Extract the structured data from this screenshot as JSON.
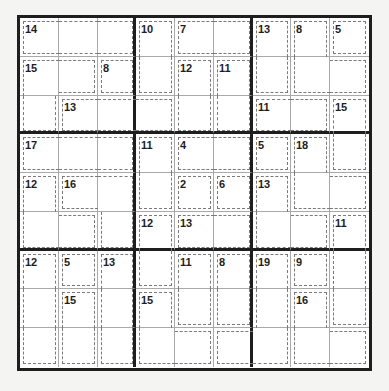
{
  "puzzle": {
    "type": "Killer Sudoku",
    "size": 9,
    "colors": {
      "background": "#ffffff",
      "thick_line": "#1e1e1e",
      "thin_line": "#a9a9a9",
      "cage_line": "#7a7a7a",
      "text": "#1e1e1e"
    },
    "cages": [
      {
        "sum": "14",
        "cells": [
          [
            0,
            0
          ],
          [
            0,
            1
          ],
          [
            0,
            2
          ]
        ]
      },
      {
        "sum": "10",
        "cells": [
          [
            0,
            3
          ],
          [
            1,
            3
          ]
        ]
      },
      {
        "sum": "7",
        "cells": [
          [
            0,
            4
          ],
          [
            0,
            5
          ]
        ]
      },
      {
        "sum": "13",
        "cells": [
          [
            0,
            6
          ],
          [
            1,
            6
          ]
        ]
      },
      {
        "sum": "8",
        "cells": [
          [
            0,
            7
          ],
          [
            1,
            7
          ],
          [
            1,
            8
          ]
        ]
      },
      {
        "sum": "5",
        "cells": [
          [
            0,
            8
          ]
        ]
      },
      {
        "sum": "15",
        "cells": [
          [
            1,
            0
          ],
          [
            1,
            1
          ],
          [
            2,
            0
          ]
        ]
      },
      {
        "sum": "8",
        "cells": [
          [
            1,
            2
          ]
        ]
      },
      {
        "sum": "12",
        "cells": [
          [
            1,
            4
          ],
          [
            2,
            4
          ]
        ]
      },
      {
        "sum": "11",
        "cells": [
          [
            1,
            5
          ],
          [
            2,
            5
          ]
        ]
      },
      {
        "sum": "13",
        "cells": [
          [
            2,
            1
          ],
          [
            2,
            2
          ],
          [
            2,
            3
          ]
        ]
      },
      {
        "sum": "11",
        "cells": [
          [
            2,
            6
          ],
          [
            2,
            7
          ]
        ]
      },
      {
        "sum": "15",
        "cells": [
          [
            2,
            8
          ],
          [
            3,
            8
          ]
        ]
      },
      {
        "sum": "17",
        "cells": [
          [
            3,
            0
          ],
          [
            3,
            1
          ],
          [
            3,
            2
          ]
        ]
      },
      {
        "sum": "11",
        "cells": [
          [
            3,
            3
          ],
          [
            4,
            3
          ]
        ]
      },
      {
        "sum": "4",
        "cells": [
          [
            3,
            4
          ],
          [
            3,
            5
          ]
        ]
      },
      {
        "sum": "5",
        "cells": [
          [
            3,
            6
          ]
        ]
      },
      {
        "sum": "18",
        "cells": [
          [
            3,
            7
          ],
          [
            4,
            7
          ],
          [
            4,
            8
          ]
        ]
      },
      {
        "sum": "12",
        "cells": [
          [
            4,
            0
          ],
          [
            5,
            0
          ],
          [
            5,
            1
          ]
        ]
      },
      {
        "sum": "16",
        "cells": [
          [
            4,
            1
          ],
          [
            4,
            2
          ],
          [
            5,
            2
          ]
        ]
      },
      {
        "sum": "2",
        "cells": [
          [
            4,
            4
          ]
        ]
      },
      {
        "sum": "6",
        "cells": [
          [
            4,
            5
          ]
        ]
      },
      {
        "sum": "13",
        "cells": [
          [
            4,
            6
          ],
          [
            5,
            6
          ],
          [
            5,
            7
          ]
        ]
      },
      {
        "sum": "12",
        "cells": [
          [
            5,
            3
          ],
          [
            6,
            3
          ]
        ]
      },
      {
        "sum": "13",
        "cells": [
          [
            5,
            4
          ],
          [
            5,
            5
          ]
        ]
      },
      {
        "sum": "11",
        "cells": [
          [
            5,
            8
          ],
          [
            6,
            8
          ],
          [
            7,
            8
          ]
        ]
      },
      {
        "sum": "12",
        "cells": [
          [
            6,
            0
          ],
          [
            7,
            0
          ],
          [
            8,
            0
          ]
        ]
      },
      {
        "sum": "5",
        "cells": [
          [
            6,
            1
          ]
        ]
      },
      {
        "sum": "13",
        "cells": [
          [
            6,
            2
          ],
          [
            7,
            2
          ],
          [
            8,
            2
          ]
        ]
      },
      {
        "sum": "11",
        "cells": [
          [
            6,
            4
          ],
          [
            7,
            4
          ]
        ]
      },
      {
        "sum": "8",
        "cells": [
          [
            6,
            5
          ],
          [
            7,
            5
          ]
        ]
      },
      {
        "sum": "9",
        "cells": [
          [
            6,
            7
          ]
        ]
      },
      {
        "sum": "15",
        "cells": [
          [
            7,
            1
          ],
          [
            8,
            1
          ]
        ]
      },
      {
        "sum": "15",
        "cells": [
          [
            7,
            3
          ],
          [
            8,
            3
          ],
          [
            8,
            4
          ]
        ]
      },
      {
        "sum": "19",
        "cells": [
          [
            6,
            6
          ],
          [
            7,
            6
          ],
          [
            8,
            5
          ],
          [
            8,
            6
          ]
        ]
      },
      {
        "sum": "16",
        "cells": [
          [
            7,
            7
          ],
          [
            8,
            7
          ],
          [
            8,
            8
          ]
        ]
      }
    ]
  }
}
